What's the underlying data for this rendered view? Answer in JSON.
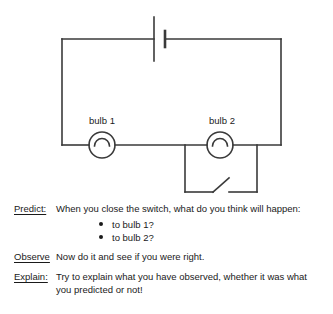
{
  "diagram": {
    "stroke_color": "#3a3a3a",
    "labels": {
      "bulb1": "bulb 1",
      "bulb2": "bulb 2"
    },
    "components": {
      "battery": "battery-symbol",
      "bulb1": "lamp-symbol",
      "bulb2": "lamp-symbol",
      "switch": "open-switch-symbol"
    }
  },
  "worksheet": {
    "predict": {
      "label": "Predict:",
      "body": "When you close the switch, what do you think will happen:",
      "bullets": [
        "to bulb 1?",
        "to bulb 2?"
      ]
    },
    "observe": {
      "label": "Observe",
      "body": "Now do it and see if you were right."
    },
    "explain": {
      "label": "Explain:",
      "body": "Try to explain what you have observed, whether it was what you predicted or not!"
    }
  }
}
